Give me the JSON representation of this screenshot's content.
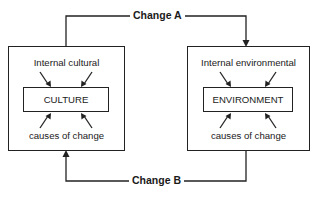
{
  "diagram": {
    "type": "flow",
    "nodes": [
      {
        "id": "culture",
        "inner_label": "CULTURE",
        "top_caption": "Internal cultural",
        "bottom_caption": "causes of change"
      },
      {
        "id": "environment",
        "inner_label": "ENVIRONMENT",
        "top_caption": "Internal environmental",
        "bottom_caption": "causes of change"
      }
    ],
    "edges": [
      {
        "from": "culture",
        "to": "environment",
        "label": "Change A"
      },
      {
        "from": "environment",
        "to": "culture",
        "label": "Change B"
      }
    ]
  },
  "labels": {
    "change_a": "Change A",
    "change_b": "Change B",
    "culture_top": "Internal cultural",
    "culture_inner": "CULTURE",
    "culture_bottom": "causes of change",
    "env_top": "Internal environmental",
    "env_inner": "ENVIRONMENT",
    "env_bottom": "causes of change"
  }
}
